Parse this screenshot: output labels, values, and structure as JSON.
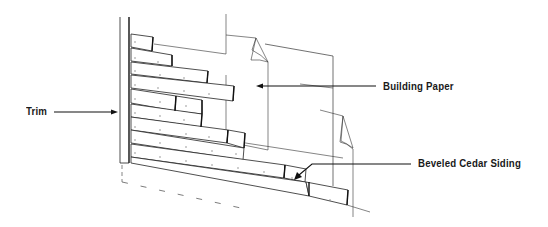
{
  "diagram": {
    "labels": {
      "trim": "Trim",
      "building_paper": "Building Paper",
      "beveled_cedar_siding": "Beveled Cedar Siding"
    },
    "callouts": [
      {
        "id": "trim",
        "text": "Trim",
        "points_to": "corner trim board"
      },
      {
        "id": "building_paper",
        "text": "Building Paper",
        "points_to": "building paper layer"
      },
      {
        "id": "beveled_cedar_siding",
        "text": "Beveled Cedar Siding",
        "points_to": "siding courses"
      }
    ],
    "components": [
      "corner trim",
      "building paper sheets with curled corners",
      "staggered beveled siding boards",
      "dashed foundation outline"
    ],
    "colors": {
      "line": "#222222",
      "background": "#ffffff",
      "text": "#1a1a1a"
    }
  }
}
